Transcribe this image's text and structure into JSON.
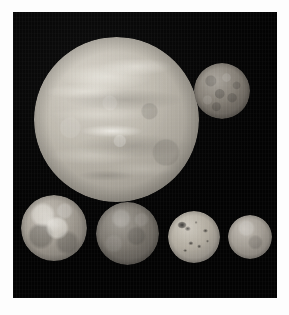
{
  "image": {
    "kind": "astronomical-photo-composite",
    "subject": "Jupiter and its four Galilean moons shown to relative scale",
    "background_color": "#050505",
    "frame_color": "#fdfdfd",
    "width": 289,
    "height": 315
  },
  "bodies": [
    {
      "id": "jupiter",
      "name": "Jupiter",
      "role": "primary-planet",
      "appearance": "large pale tan-gray banded sphere with mottled cloud belts and bright zones",
      "base_color": "#bdb8ad",
      "highlight_color": "#eeece4",
      "shadow_color": "#7e7a72",
      "diameter_px": 165,
      "center_x": 116,
      "center_y": 119,
      "position": "upper-center"
    },
    {
      "id": "callisto",
      "name": "Callisto",
      "role": "galilean-moon",
      "appearance": "dark gray heavily cratered sphere",
      "base_color": "#837d74",
      "highlight_color": "#9a948a",
      "shadow_color": "#413d38",
      "diameter_px": 56,
      "center_x": 222,
      "center_y": 91,
      "position": "upper-right"
    },
    {
      "id": "ganymede",
      "name": "Ganymede",
      "role": "galilean-moon",
      "appearance": "gray sphere with bright ray-crater patches and dark terrain",
      "base_color": "#a39d93",
      "highlight_color": "#f5f3ec",
      "shadow_color": "#56524c",
      "diameter_px": 66,
      "center_x": 54,
      "center_y": 228,
      "position": "bottom-left"
    },
    {
      "id": "moon3",
      "name": "Europa",
      "role": "galilean-moon",
      "appearance": "darker uniform gray sphere with faint mottling",
      "base_color": "#7b766e",
      "highlight_color": "#8f8a81",
      "shadow_color": "#3b3833",
      "diameter_px": 63,
      "center_x": 127,
      "center_y": 233,
      "position": "bottom-center-left"
    },
    {
      "id": "io",
      "name": "Io",
      "role": "galilean-moon",
      "appearance": "pale sphere speckled with dark volcanic spots",
      "base_color": "#b0aa9e",
      "highlight_color": "#c5bfb3",
      "shadow_color": "#5d5953",
      "spot_color": "#121210",
      "diameter_px": 52,
      "center_x": 194,
      "center_y": 237,
      "position": "bottom-center-right"
    },
    {
      "id": "europa",
      "name": "Europa",
      "role": "galilean-moon",
      "appearance": "small smooth pale gray sphere, smallest body in frame",
      "base_color": "#a19b92",
      "highlight_color": "#b6b0a6",
      "shadow_color": "#55514b",
      "diameter_px": 44,
      "center_x": 250,
      "center_y": 237,
      "position": "bottom-right"
    }
  ]
}
